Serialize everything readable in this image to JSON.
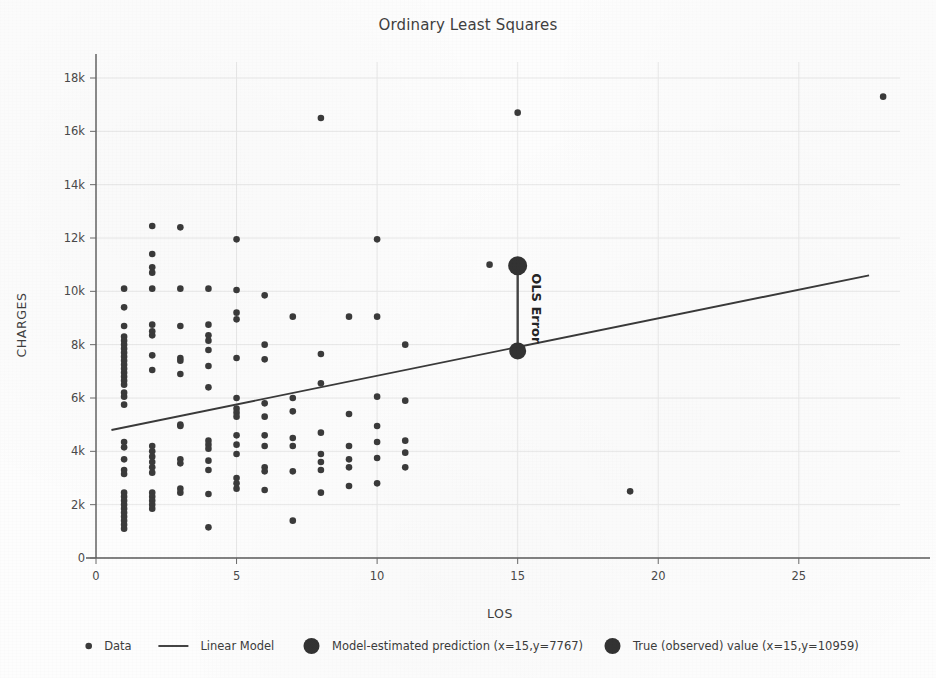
{
  "chart_data": {
    "type": "scatter",
    "title": "Ordinary Least Squares",
    "xlabel": "LOS",
    "ylabel": "CHARGES",
    "xlim": [
      0,
      28.6
    ],
    "ylim": [
      0,
      18600
    ],
    "xticks": [
      0,
      5,
      10,
      15,
      20,
      25
    ],
    "xticklabels": [
      "0",
      "5",
      "10",
      "15",
      "20",
      "25"
    ],
    "yticks": [
      0,
      2000,
      4000,
      6000,
      8000,
      10000,
      12000,
      14000,
      16000,
      18000
    ],
    "yticklabels": [
      "0",
      "2k",
      "4k",
      "6k",
      "8k",
      "10k",
      "12k",
      "14k",
      "16k",
      "18k"
    ],
    "grid": true,
    "grid_color": "#e8e8e8",
    "legend_position": "below-axes",
    "marker_color": "#3b3b3b",
    "line_color": "#3a3a3a",
    "highlight_color": "#333333",
    "series": [
      {
        "name": "Data",
        "type": "scatter",
        "points": [
          [
            1,
            10100
          ],
          [
            1,
            9400
          ],
          [
            1,
            8700
          ],
          [
            1,
            8300
          ],
          [
            1,
            8150
          ],
          [
            1,
            8000
          ],
          [
            1,
            7850
          ],
          [
            1,
            7700
          ],
          [
            1,
            7550
          ],
          [
            1,
            7400
          ],
          [
            1,
            7250
          ],
          [
            1,
            7100
          ],
          [
            1,
            6950
          ],
          [
            1,
            6800
          ],
          [
            1,
            6650
          ],
          [
            1,
            6500
          ],
          [
            1,
            6200
          ],
          [
            1,
            6050
          ],
          [
            1,
            5750
          ],
          [
            1,
            4350
          ],
          [
            1,
            4150
          ],
          [
            1,
            3700
          ],
          [
            1,
            3300
          ],
          [
            1,
            3150
          ],
          [
            1,
            2450
          ],
          [
            1,
            2300
          ],
          [
            1,
            2150
          ],
          [
            1,
            2000
          ],
          [
            1,
            1850
          ],
          [
            1,
            1700
          ],
          [
            1,
            1550
          ],
          [
            1,
            1400
          ],
          [
            1,
            1250
          ],
          [
            1,
            1100
          ],
          [
            2,
            12450
          ],
          [
            2,
            11400
          ],
          [
            2,
            10900
          ],
          [
            2,
            10700
          ],
          [
            2,
            10100
          ],
          [
            2,
            8750
          ],
          [
            2,
            8500
          ],
          [
            2,
            8350
          ],
          [
            2,
            7600
          ],
          [
            2,
            7050
          ],
          [
            2,
            4200
          ],
          [
            2,
            4000
          ],
          [
            2,
            3800
          ],
          [
            2,
            3600
          ],
          [
            2,
            3400
          ],
          [
            2,
            3200
          ],
          [
            2,
            2450
          ],
          [
            2,
            2300
          ],
          [
            2,
            2150
          ],
          [
            2,
            2000
          ],
          [
            2,
            1850
          ],
          [
            3,
            10100
          ],
          [
            3,
            8700
          ],
          [
            3,
            7500
          ],
          [
            3,
            7400
          ],
          [
            3,
            6900
          ],
          [
            3,
            5000
          ],
          [
            3,
            4950
          ],
          [
            3,
            3700
          ],
          [
            3,
            3550
          ],
          [
            3,
            2600
          ],
          [
            3,
            2450
          ],
          [
            3,
            12400
          ],
          [
            4,
            10100
          ],
          [
            4,
            8750
          ],
          [
            4,
            8350
          ],
          [
            4,
            8150
          ],
          [
            4,
            7800
          ],
          [
            4,
            7200
          ],
          [
            4,
            6400
          ],
          [
            4,
            4400
          ],
          [
            4,
            4250
          ],
          [
            4,
            4100
          ],
          [
            4,
            3650
          ],
          [
            4,
            3300
          ],
          [
            4,
            2400
          ],
          [
            4,
            1150
          ],
          [
            5,
            11950
          ],
          [
            5,
            10050
          ],
          [
            5,
            9200
          ],
          [
            5,
            8950
          ],
          [
            5,
            7500
          ],
          [
            5,
            6000
          ],
          [
            5,
            5600
          ],
          [
            5,
            5450
          ],
          [
            5,
            5300
          ],
          [
            5,
            4600
          ],
          [
            5,
            4250
          ],
          [
            5,
            3900
          ],
          [
            5,
            3000
          ],
          [
            5,
            2800
          ],
          [
            5,
            2600
          ],
          [
            6,
            9850
          ],
          [
            6,
            8000
          ],
          [
            6,
            7450
          ],
          [
            6,
            5800
          ],
          [
            6,
            5300
          ],
          [
            6,
            4600
          ],
          [
            6,
            4200
          ],
          [
            6,
            3400
          ],
          [
            6,
            3250
          ],
          [
            6,
            2550
          ],
          [
            7,
            9050
          ],
          [
            7,
            6000
          ],
          [
            7,
            5500
          ],
          [
            7,
            4500
          ],
          [
            7,
            4200
          ],
          [
            7,
            3250
          ],
          [
            7,
            1400
          ],
          [
            8,
            16500
          ],
          [
            8,
            7650
          ],
          [
            8,
            6550
          ],
          [
            8,
            4700
          ],
          [
            8,
            3900
          ],
          [
            8,
            3600
          ],
          [
            8,
            3300
          ],
          [
            8,
            2450
          ],
          [
            9,
            9050
          ],
          [
            9,
            5400
          ],
          [
            9,
            4200
          ],
          [
            9,
            3700
          ],
          [
            9,
            3400
          ],
          [
            9,
            2700
          ],
          [
            10,
            11950
          ],
          [
            10,
            9050
          ],
          [
            10,
            6050
          ],
          [
            10,
            4950
          ],
          [
            10,
            4350
          ],
          [
            10,
            3750
          ],
          [
            10,
            2800
          ],
          [
            11,
            8000
          ],
          [
            11,
            5900
          ],
          [
            11,
            4400
          ],
          [
            11,
            3950
          ],
          [
            11,
            3400
          ],
          [
            14,
            11000
          ],
          [
            15,
            16700
          ],
          [
            19,
            2500
          ],
          [
            28,
            17300
          ]
        ]
      },
      {
        "name": "Linear Model",
        "type": "line",
        "x": [
          0.55,
          27.5
        ],
        "y": [
          4800,
          10600
        ],
        "slope": 215.6,
        "intercept": 4681.4
      }
    ],
    "highlights": [
      {
        "name": "Model-estimated prediction",
        "x": 15,
        "y": 7767,
        "label": "Model-estimated prediction (x=15,y=7767)",
        "marker_size": 17
      },
      {
        "name": "True (observed) value",
        "x": 15,
        "y": 10959,
        "label": "True (observed) value (x=15,y=10959)",
        "marker_size": 19
      }
    ],
    "annotations": [
      {
        "text": "OLS Error",
        "x": 15,
        "y_from": 7767,
        "y_to": 10959,
        "rotation": 90
      }
    ]
  },
  "legend": {
    "items": [
      {
        "label": "Data",
        "marker": "small-dot"
      },
      {
        "label": "Linear Model",
        "marker": "line-segment"
      },
      {
        "label": "Model-estimated prediction (x=15,y=7767)",
        "marker": "large-dot"
      },
      {
        "label": "True (observed) value (x=15,y=10959)",
        "marker": "large-dot"
      }
    ]
  }
}
